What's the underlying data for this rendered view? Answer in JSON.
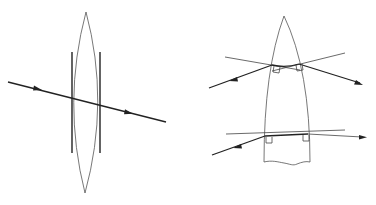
{
  "figure": {
    "left_diagram": {
      "name": "biconvex-lens",
      "elements": [
        "lens-outline",
        "left-thin-lens-bar",
        "right-thin-lens-bar",
        "ray-with-arrows"
      ]
    },
    "right_diagram": {
      "name": "tapered-lens-section",
      "elements": [
        "section-outline",
        "wavy-cut-bottom",
        "upper-ray",
        "lower-ray",
        "upper-normals",
        "lower-normal",
        "right-angle-markers"
      ]
    },
    "colors": {
      "background": "#ffffff",
      "ray": "#222222",
      "outline": "#555555"
    }
  }
}
